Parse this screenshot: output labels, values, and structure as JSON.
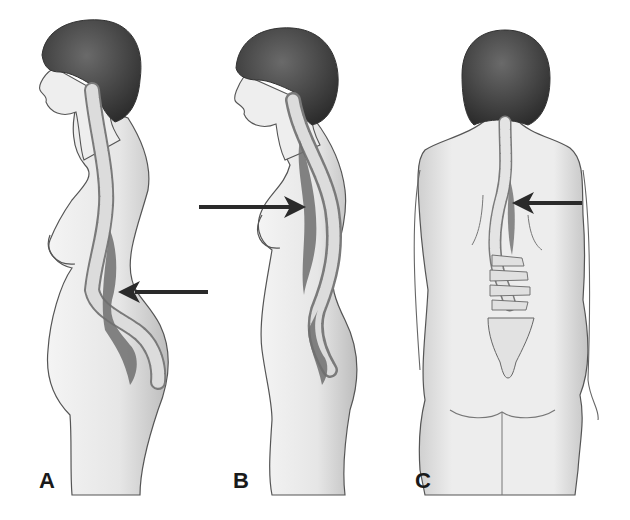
{
  "figure": {
    "panels": [
      {
        "id": "A",
        "label": "A",
        "view": "side",
        "arrow_direction": "left",
        "arrow_target": "lumbar curve"
      },
      {
        "id": "B",
        "label": "B",
        "view": "side",
        "arrow_direction": "right",
        "arrow_target": "thoracic curve"
      },
      {
        "id": "C",
        "label": "C",
        "view": "back",
        "arrow_direction": "left",
        "arrow_target": "thoracic lateral curve"
      }
    ],
    "colors": {
      "background": "#ffffff",
      "skin": "#ececec",
      "skin_shade": "#c9c9c9",
      "outline": "#555555",
      "hair": "#3a3a3a",
      "spine": "#d8d8d8",
      "spine_shadow": "#6e6e6e",
      "arrow": "#2a2a2a"
    }
  }
}
